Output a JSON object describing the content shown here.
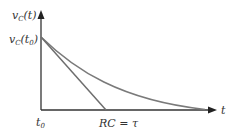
{
  "diagram": {
    "type": "rc-discharge-curve",
    "y_axis_label": {
      "main": "v",
      "sub": "C",
      "arg": "(t)"
    },
    "y0_label": {
      "main": "v",
      "sub": "C",
      "arg": "(t",
      "argsub": "0",
      "close": ")"
    },
    "x_axis_label": "t",
    "x0_label": {
      "main": "t",
      "sub": "0"
    },
    "tau_label": "RC = τ",
    "colors": {
      "axis": "#333333",
      "curve": "#7a7a7a",
      "tangent": "#6e6e6e"
    }
  }
}
